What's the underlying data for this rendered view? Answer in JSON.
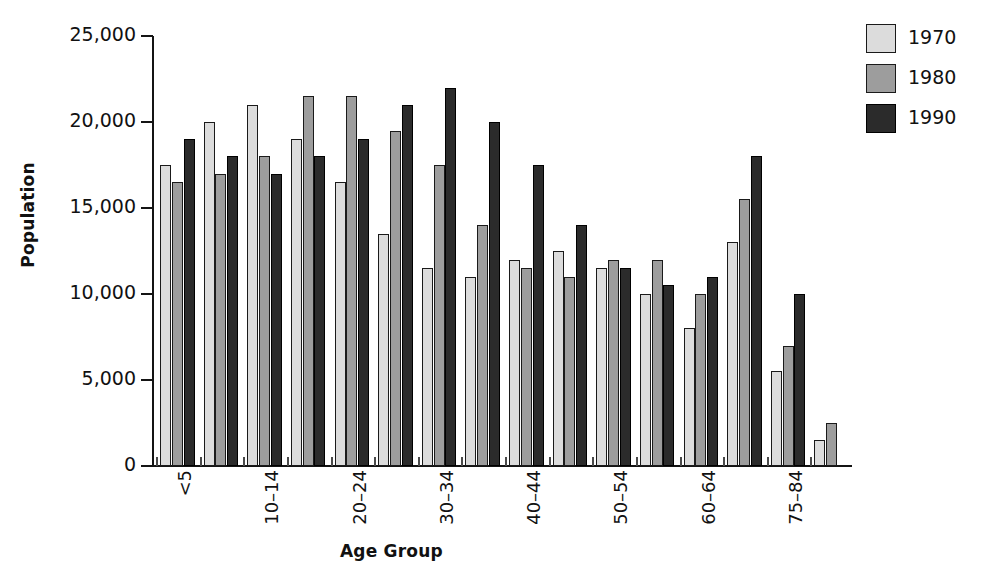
{
  "chart_data": {
    "type": "bar",
    "title": "",
    "xlabel": "Age Group",
    "ylabel": "Population",
    "ylim": [
      0,
      25000
    ],
    "yticks": [
      0,
      5000,
      10000,
      15000,
      20000,
      25000
    ],
    "ytick_labels": [
      "0",
      "5,000",
      "10,000",
      "15,000",
      "20,000",
      "25,000"
    ],
    "grid": false,
    "legend_position": "top-right",
    "categories": [
      "<5",
      "5–9",
      "10–14",
      "15–19",
      "20–24",
      "25–29",
      "30–34",
      "35–39",
      "40–44",
      "45–49",
      "50–54",
      "55–59",
      "60–64",
      "65–74",
      "75–84",
      "85+"
    ],
    "visible_tick_labels": [
      "<5",
      "",
      "10–14",
      "",
      "20–24",
      "",
      "30–34",
      "",
      "40–44",
      "",
      "50–54",
      "",
      "60–64",
      "",
      "75–84",
      ""
    ],
    "series": [
      {
        "name": "1970",
        "color": "#dcdcdc",
        "values": [
          17500,
          20000,
          21000,
          19000,
          16500,
          13500,
          11500,
          11000,
          12000,
          12500,
          11500,
          10000,
          8000,
          13000,
          5500,
          1500
        ]
      },
      {
        "name": "1980",
        "color": "#9d9d9d",
        "values": [
          16500,
          17000,
          18000,
          21500,
          21500,
          19500,
          17500,
          14000,
          11500,
          11000,
          12000,
          12000,
          10000,
          15500,
          7000,
          2500
        ]
      },
      {
        "name": "1990",
        "color": "#2b2b2b",
        "values": [
          19000,
          18000,
          17000,
          18000,
          19000,
          21000,
          22000,
          20000,
          17500,
          14000,
          11500,
          10500,
          11000,
          18000,
          10000,
          null
        ]
      }
    ]
  },
  "legend": {
    "items": [
      {
        "label": "1970",
        "swatch_class": "s1970"
      },
      {
        "label": "1980",
        "swatch_class": "s1980"
      },
      {
        "label": "1990",
        "swatch_class": "s1990"
      }
    ]
  }
}
